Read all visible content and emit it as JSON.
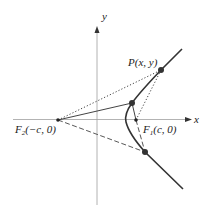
{
  "diagram": {
    "axes": {
      "x_label": "x",
      "y_label": "y"
    },
    "points": {
      "P": {
        "label": "P(x, y)"
      },
      "F1": {
        "label_main": "F",
        "label_sub": "1",
        "label_rest": "(c, 0)"
      },
      "F2": {
        "label_main": "F",
        "label_sub": "2",
        "label_rest": "(−c, 0)"
      }
    },
    "colors": {
      "axis": "#999999",
      "curve": "#333333",
      "line": "#444444"
    }
  }
}
